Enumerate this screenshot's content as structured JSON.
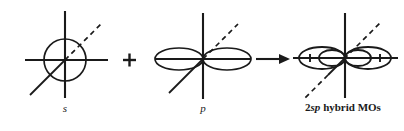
{
  "figure": {
    "background_color": "#ffffff",
    "stroke_color": "#1a1a1a",
    "width": 404,
    "height": 131
  },
  "operators": {
    "plus": "+",
    "arrow": "→"
  },
  "panels": [
    {
      "id": "s-orbital",
      "label_plain": "s",
      "label_italic_part": "s",
      "label_prefix": "",
      "shape": "circle",
      "center": {
        "x": 65,
        "y": 60
      },
      "radius": 21,
      "axes": {
        "horizontal": {
          "x1": 25,
          "x2": 108,
          "y": 60
        },
        "vertical": {
          "y1": 11,
          "y2": 98,
          "x": 65
        },
        "diagonal_solid": {
          "x1": 30,
          "y1": 95,
          "x2": 65,
          "y2": 60
        },
        "diagonal_dashed": {
          "x1": 65,
          "y1": 60,
          "x2": 100,
          "y2": 25
        }
      }
    },
    {
      "id": "p-orbital",
      "label_plain": "p",
      "label_italic_part": "p",
      "label_prefix": "",
      "shape": "two-lobes",
      "center": {
        "x": 203,
        "y": 59
      },
      "lobe_rx": 24,
      "lobe_ry": 11,
      "axes": {
        "horizontal": {
          "x1": 155,
          "x2": 250,
          "y": 59
        },
        "vertical": {
          "y1": 13,
          "y2": 99,
          "x": 203
        },
        "diagonal_solid": {
          "x1": 169,
          "y1": 93,
          "x2": 203,
          "y2": 59
        },
        "diagonal_dashed": {
          "x1": 203,
          "y1": 59,
          "x2": 237,
          "y2": 25
        }
      }
    },
    {
      "id": "sp-hybrid-orbitals",
      "label_plain": "2sp hybrid MOs",
      "label_prefix": "2",
      "label_italic_part": "sp",
      "label_suffix": " hybrid MOs",
      "shape": "four-lobes",
      "center": {
        "x": 345,
        "y": 58
      },
      "outer_lobe_rx": 22,
      "outer_lobe_ry": 11,
      "inner_lobe_rx": 13,
      "inner_lobe_ry": 8,
      "signs": {
        "outer_left": "+",
        "inner_left": "−",
        "inner_right": "−",
        "outer_right": "+"
      },
      "axes": {
        "horizontal": {
          "x1": 292,
          "x2": 397,
          "y": 58
        },
        "vertical": {
          "y1": 13,
          "y2": 98,
          "x": 345
        },
        "diagonal_solid": {
          "x1": 327,
          "y1": 76,
          "x2": 345,
          "y2": 58
        },
        "diagonal_dashed_upper": {
          "x1": 345,
          "y1": 58,
          "x2": 380,
          "y2": 23
        },
        "diagonal_dashed_lower": {
          "x1": 327,
          "y1": 76,
          "x2": 304,
          "y2": 99
        }
      }
    }
  ],
  "operator_positions": {
    "plus": {
      "x": 129,
      "y": 54
    },
    "arrow": {
      "x": 258,
      "y": 54,
      "length": 32
    }
  },
  "captions": [
    {
      "for": "s-orbital",
      "x": 65,
      "y": 108,
      "text": "s",
      "style": "italic"
    },
    {
      "for": "p-orbital",
      "x": 203,
      "y": 108,
      "text": "p",
      "style": "italic"
    },
    {
      "for": "sp-hybrid-orbitals",
      "x": 343,
      "y": 107,
      "text": "2sp hybrid MOs",
      "style": "bold-mixed"
    }
  ]
}
